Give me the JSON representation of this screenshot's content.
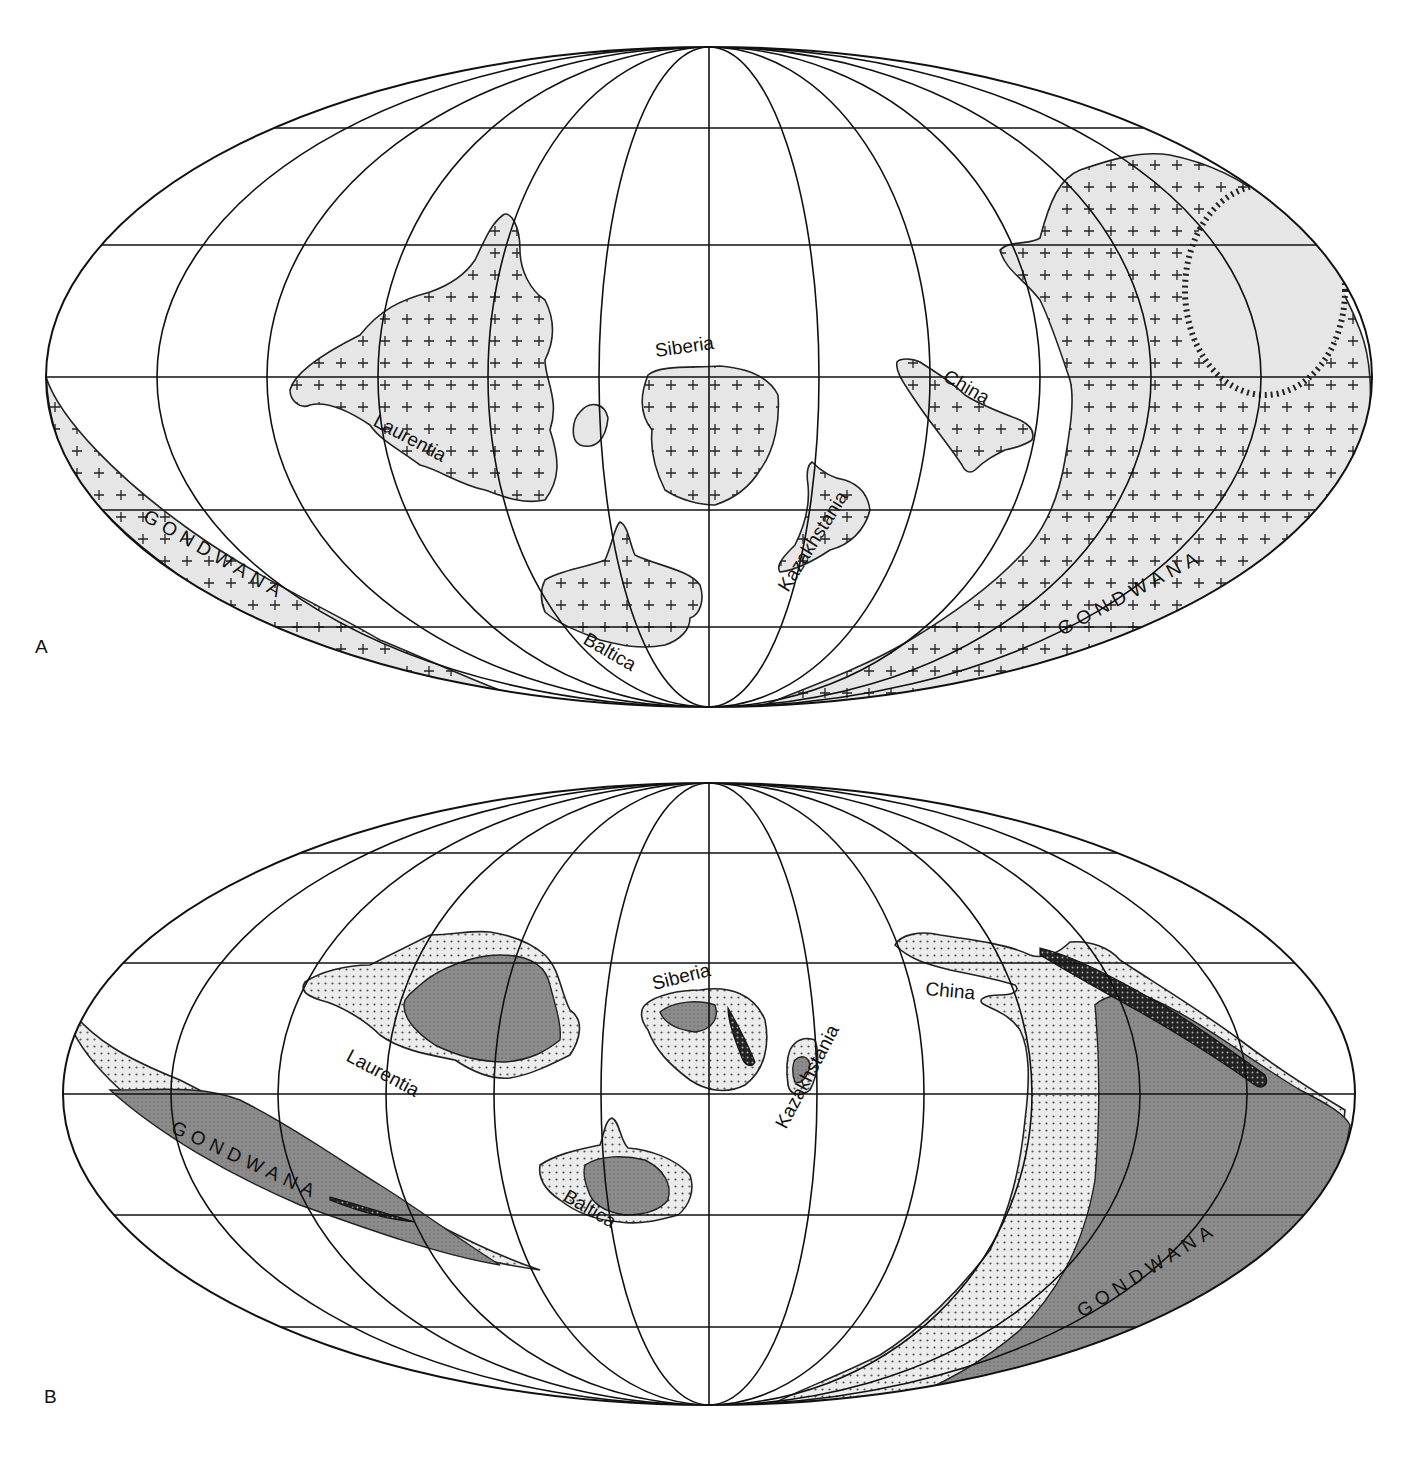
{
  "figure": {
    "type": "paleogeographic maps (Mollweide projection)",
    "panels": [
      {
        "id": "A",
        "letter": "A",
        "labels": {
          "laurentia": "Laurentia",
          "siberia": "Siberia",
          "china": "China",
          "kazakhstania": "Kazakhstania",
          "baltica": "Baltica",
          "gondwana_west": "GONDWANA",
          "gondwana_east": "GONDWANA"
        },
        "fill_style": "light gray with cross (+) symbols"
      },
      {
        "id": "B",
        "letter": "B",
        "labels": {
          "laurentia": "Laurentia",
          "siberia": "Siberia",
          "china": "China",
          "kazakhstania": "Kazakhstania",
          "baltica": "Baltica",
          "gondwana_west": "GONDWANA",
          "gondwana_east": "GONDWANA"
        },
        "fill_style": "stippled shelf, dark gray interior, black dotted belts"
      }
    ],
    "colors": {
      "ink": "#111111",
      "land_light": "#e6e6e6",
      "land_dark": "#8a8a8a",
      "background": "#ffffff"
    }
  }
}
